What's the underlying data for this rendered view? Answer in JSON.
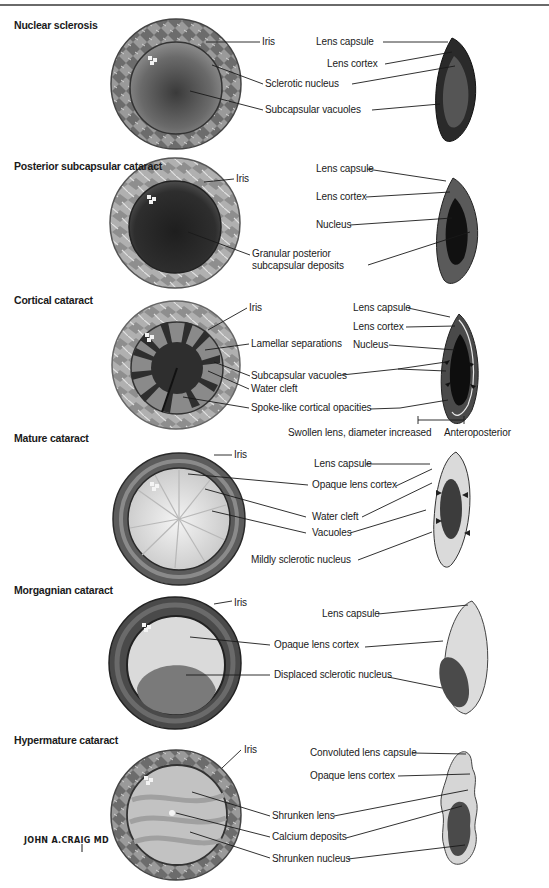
{
  "figure": {
    "colors": {
      "line": "#1a1a1a",
      "iris_light": "#b5b5b5",
      "iris_dark": "#5a5a5a",
      "dark_fill": "#2a2a2a",
      "mid_fill": "#6e6e6e",
      "light_fill": "#d6d6d6"
    },
    "sections": [
      {
        "title": "Nuclear sclerosis",
        "front_labels": [
          "Iris",
          "Sclerotic nucleus",
          "Subcapsular vacuoles"
        ],
        "side_labels": [
          "Lens capsule",
          "Lens cortex"
        ]
      },
      {
        "title": "Posterior subcapsular cataract",
        "front_labels": [
          "Iris",
          "Granular posterior",
          "subcapsular deposits"
        ],
        "side_labels": [
          "Lens capsule",
          "Lens cortex",
          "Nucleus"
        ]
      },
      {
        "title": "Cortical cataract",
        "front_labels": [
          "Iris",
          "Lamellar separations",
          "Subcapsular vacuoles",
          "Water cleft",
          "Spoke-like cortical opacities"
        ],
        "side_labels": [
          "Lens capsule",
          "Lens cortex",
          "Nucleus"
        ],
        "dimension_labels": [
          "Swollen lens, diameter increased",
          "Anteroposterior"
        ]
      },
      {
        "title": "Mature cataract",
        "front_labels": [
          "Iris",
          "Opaque lens cortex",
          "Water cleft",
          "Vacuoles",
          "Mildly sclerotic nucleus"
        ],
        "side_labels": [
          "Lens capsule"
        ]
      },
      {
        "title": "Morgagnian cataract",
        "front_labels": [
          "Iris",
          "Opaque lens cortex",
          "Displaced sclerotic nucleus"
        ],
        "side_labels": [
          "Lens capsule"
        ]
      },
      {
        "title": "Hypermature cataract",
        "front_labels": [
          "Iris",
          "Shrunken lens",
          "Calcium deposits",
          "Shrunken nucleus"
        ],
        "side_labels": [
          "Convoluted lens capsule",
          "Opaque lens cortex"
        ]
      }
    ],
    "signature": "JOHN A.CRAIG MD"
  }
}
